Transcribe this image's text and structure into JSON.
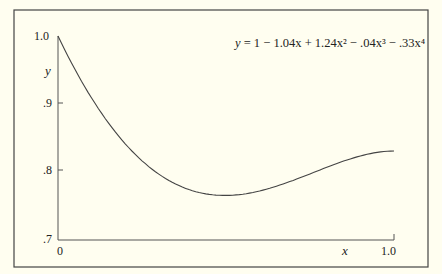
{
  "chart_data": {
    "type": "line",
    "title": "",
    "equation": "y = 1 − 1.04x + 1.24x² − .04x³ − .33x⁴",
    "coefficients": [
      1,
      -1.04,
      1.24,
      -0.04,
      -0.33
    ],
    "xlabel": "x",
    "ylabel": "y",
    "xlim": [
      0,
      1.0
    ],
    "ylim": [
      0.7,
      1.0
    ],
    "x_ticks": [
      "0",
      "1.0"
    ],
    "y_ticks": [
      "1.0",
      ".9",
      ".8",
      ".7"
    ],
    "grid": false,
    "legend": null,
    "series": [
      {
        "name": "y",
        "x": [
          0,
          0.1,
          0.2,
          0.3,
          0.4,
          0.5,
          0.6,
          0.7,
          0.8,
          0.9,
          1.0
        ],
        "values": [
          1.0,
          0.908,
          0.84,
          0.797,
          0.776,
          0.776,
          0.792,
          0.813,
          0.83,
          0.836,
          0.83
        ]
      }
    ]
  },
  "labels": {
    "eq_prefix": "y",
    "eq_rest": " = 1 − 1.04x + 1.24x² − .04x³ − .33x⁴",
    "y_axis": "y",
    "x_axis": "x",
    "y1": "1.0",
    "y09": ".9",
    "y08": ".8",
    "y07": ".7",
    "x0": "0",
    "x1": "1.0"
  }
}
